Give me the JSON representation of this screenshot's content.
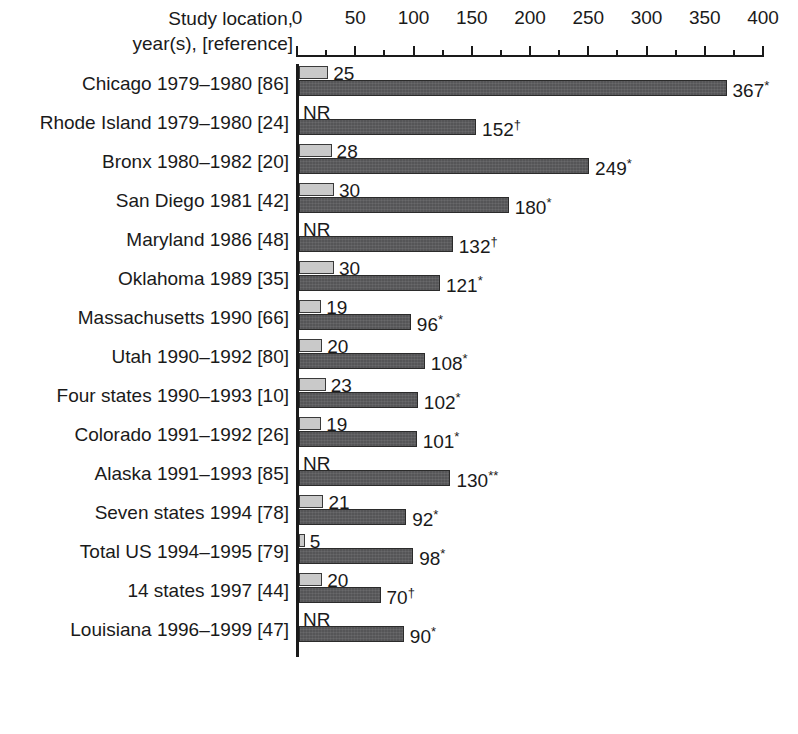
{
  "chart_data": {
    "type": "bar",
    "orientation": "horizontal",
    "title": "",
    "xlabel": "",
    "ylabel": "",
    "header": {
      "row_axis_caption_line1": "Study location,",
      "row_axis_caption_line2": "year(s), [reference]"
    },
    "xlim": [
      0,
      400
    ],
    "xticks": [
      0,
      50,
      100,
      150,
      200,
      250,
      300,
      350,
      400
    ],
    "xticklabels": [
      "0",
      "50",
      "100",
      "150",
      "200",
      "250",
      "300",
      "350",
      "400"
    ],
    "minor_tick_step": 25,
    "grid": false,
    "legend_position": "none",
    "not_reported_text": "NR",
    "series": [
      {
        "name": "light-bar",
        "color": "#c9c9c9",
        "values": [
          25,
          null,
          28,
          30,
          null,
          30,
          19,
          20,
          23,
          19,
          null,
          21,
          5,
          20,
          null
        ]
      },
      {
        "name": "dark-bar",
        "color": "#555557",
        "values": [
          367,
          152,
          249,
          180,
          132,
          121,
          96,
          108,
          102,
          101,
          130,
          92,
          98,
          70,
          90
        ]
      }
    ],
    "categories": [
      "Chicago 1979–1980 [86]",
      "Rhode Island 1979–1980 [24]",
      "Bronx 1980–1982 [20]",
      "San Diego 1981 [42]",
      "Maryland 1986 [48]",
      "Oklahoma 1989 [35]",
      "Massachusetts 1990 [66]",
      "Utah 1990–1992 [80]",
      "Four states 1990–1993 [10]",
      "Colorado 1991–1992 [26]",
      "Alaska 1991–1993 [85]",
      "Seven states 1994 [78]",
      "Total US 1994–1995 [79]",
      "14 states 1997 [44]",
      "Louisiana 1996–1999 [47]"
    ],
    "rows": [
      {
        "label": "Chicago 1979–1980 [86]",
        "light_value": 25,
        "light_label": "25",
        "light_reported": true,
        "dark_value": 367,
        "dark_label": "367",
        "dark_marker": "*"
      },
      {
        "label": "Rhode Island 1979–1980 [24]",
        "light_value": null,
        "light_label": "NR",
        "light_reported": false,
        "dark_value": 152,
        "dark_label": "152",
        "dark_marker": "†"
      },
      {
        "label": "Bronx 1980–1982 [20]",
        "light_value": 28,
        "light_label": "28",
        "light_reported": true,
        "dark_value": 249,
        "dark_label": "249",
        "dark_marker": "*"
      },
      {
        "label": "San Diego 1981 [42]",
        "light_value": 30,
        "light_label": "30",
        "light_reported": true,
        "dark_value": 180,
        "dark_label": "180",
        "dark_marker": "*"
      },
      {
        "label": "Maryland 1986 [48]",
        "light_value": null,
        "light_label": "NR",
        "light_reported": false,
        "dark_value": 132,
        "dark_label": "132",
        "dark_marker": "†"
      },
      {
        "label": "Oklahoma 1989 [35]",
        "light_value": 30,
        "light_label": "30",
        "light_reported": true,
        "dark_value": 121,
        "dark_label": "121",
        "dark_marker": "*"
      },
      {
        "label": "Massachusetts 1990 [66]",
        "light_value": 19,
        "light_label": "19",
        "light_reported": true,
        "dark_value": 96,
        "dark_label": "96",
        "dark_marker": "*"
      },
      {
        "label": "Utah 1990–1992 [80]",
        "light_value": 20,
        "light_label": "20",
        "light_reported": true,
        "dark_value": 108,
        "dark_label": "108",
        "dark_marker": "*"
      },
      {
        "label": "Four states 1990–1993 [10]",
        "light_value": 23,
        "light_label": "23",
        "light_reported": true,
        "dark_value": 102,
        "dark_label": "102",
        "dark_marker": "*"
      },
      {
        "label": "Colorado 1991–1992 [26]",
        "light_value": 19,
        "light_label": "19",
        "light_reported": true,
        "dark_value": 101,
        "dark_label": "101",
        "dark_marker": "*"
      },
      {
        "label": "Alaska 1991–1993 [85]",
        "light_value": null,
        "light_label": "NR",
        "light_reported": false,
        "dark_value": 130,
        "dark_label": "130",
        "dark_marker": "**"
      },
      {
        "label": "Seven states 1994 [78]",
        "light_value": 21,
        "light_label": "21",
        "light_reported": true,
        "dark_value": 92,
        "dark_label": "92",
        "dark_marker": "*"
      },
      {
        "label": "Total US 1994–1995 [79]",
        "light_value": 5,
        "light_label": "5",
        "light_reported": true,
        "dark_value": 98,
        "dark_label": "98",
        "dark_marker": "*"
      },
      {
        "label": "14 states 1997 [44]",
        "light_value": 20,
        "light_label": "20",
        "light_reported": true,
        "dark_value": 70,
        "dark_label": "70",
        "dark_marker": "†"
      },
      {
        "label": "Louisiana 1996–1999 [47]",
        "light_value": null,
        "light_label": "NR",
        "light_reported": false,
        "dark_value": 90,
        "dark_label": "90",
        "dark_marker": "*"
      }
    ]
  }
}
